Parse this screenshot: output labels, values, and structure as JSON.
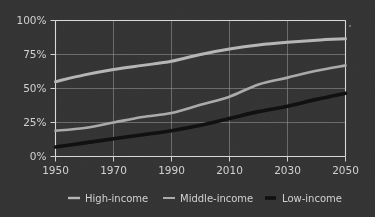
{
  "chart_data": {
    "type": "line",
    "title": "",
    "subtitle": "",
    "xlabel": "",
    "ylabel": "",
    "x": [
      1950,
      1960,
      1970,
      1980,
      1990,
      2000,
      2010,
      2020,
      2030,
      2040,
      2050
    ],
    "xlim": [
      1950,
      2050
    ],
    "ylim": [
      0,
      100
    ],
    "grid": true,
    "legend_position": "bottom",
    "x_ticks": [
      "1950",
      "1970",
      "1990",
      "2010",
      "2030",
      "2050"
    ],
    "x_tick_values": [
      1950,
      1970,
      1990,
      2010,
      2030,
      2050
    ],
    "y_ticks": [
      "0%",
      "25%",
      "50%",
      "75%",
      "100%"
    ],
    "y_tick_values": [
      0,
      25,
      50,
      75,
      100
    ],
    "series": [
      {
        "name": "High-income",
        "color": "#b4b4b4",
        "width": 3.0,
        "values": [
          55,
          60,
          64,
          67,
          70,
          75,
          79,
          82,
          84,
          85.5,
          86.5
        ]
      },
      {
        "name": "Middle-income",
        "color": "#a8a8a8",
        "width": 2.6,
        "values": [
          19,
          21,
          25,
          29,
          32,
          38,
          44,
          53,
          58,
          63,
          67
        ]
      },
      {
        "name": "Low-income",
        "color": "#101010",
        "width": 3.6,
        "values": [
          7,
          10,
          13,
          16,
          19,
          23,
          28,
          33,
          37,
          42,
          46.5
        ]
      }
    ]
  },
  "legend": {
    "items": [
      {
        "label": "High-income",
        "color": "#b4b4b4",
        "thickness": 2.4
      },
      {
        "label": "Middle-income",
        "color": "#a8a8a8",
        "thickness": 2.0
      },
      {
        "label": "Low-income",
        "color": "#101010",
        "thickness": 3.6
      }
    ]
  },
  "theme": {
    "background": "#333333",
    "axis_color": "#d8d8d8",
    "grid_color": "#9a9a9a",
    "text_color": "#cfcfcf"
  },
  "annotations": {
    "corner_marker": "·"
  }
}
